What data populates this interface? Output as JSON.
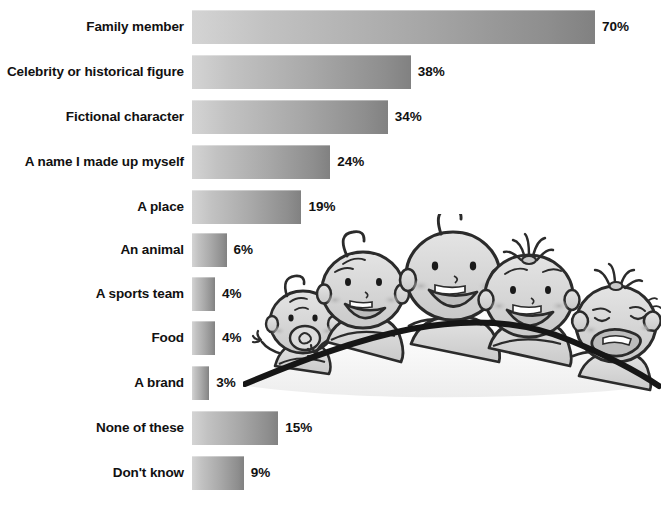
{
  "chart_data": {
    "type": "bar",
    "orientation": "horizontal",
    "title": "",
    "subtitle": "",
    "xlabel": "",
    "ylabel": "",
    "xlim": [
      0,
      70
    ],
    "grid": false,
    "legend": null,
    "value_suffix": "%",
    "categories": [
      "Family member",
      "Celebrity or historical figure",
      "Fictional character",
      "A name I made up myself",
      "A place",
      "An animal",
      "A sports team",
      "Food",
      "A brand",
      "None of these",
      "Don't know"
    ],
    "values": [
      70,
      38,
      34,
      24,
      19,
      6,
      4,
      4,
      3,
      15,
      9
    ],
    "data_labels": [
      "70%",
      "38%",
      "34%",
      "24%",
      "19%",
      "6%",
      "4%",
      "4%",
      "3%",
      "15%",
      "9%"
    ],
    "bars": [
      {
        "label": "Family member",
        "value": 70,
        "value_label": "70%",
        "top": 10
      },
      {
        "label": "Celebrity or historical figure",
        "value": 38,
        "value_label": "38%",
        "top": 55
      },
      {
        "label": "Fictional character",
        "value": 34,
        "value_label": "34%",
        "top": 100
      },
      {
        "label": "A name I made up myself",
        "value": 24,
        "value_label": "24%",
        "top": 145
      },
      {
        "label": "A place",
        "value": 19,
        "value_label": "19%",
        "top": 190
      },
      {
        "label": "An animal",
        "value": 6,
        "value_label": "6%",
        "top": 233
      },
      {
        "label": "A sports team",
        "value": 4,
        "value_label": "4%",
        "top": 277
      },
      {
        "label": "Food",
        "value": 4,
        "value_label": "4%",
        "top": 321
      },
      {
        "label": "A brand",
        "value": 3,
        "value_label": "3%",
        "top": 366
      },
      {
        "label": "None of these",
        "value": 15,
        "value_label": "15%",
        "top": 411
      },
      {
        "label": "Don't know",
        "value": 9,
        "value_label": "9%",
        "top": 456
      }
    ]
  },
  "style": {
    "background": "#ffffff",
    "text_color": "#111111",
    "bar_gradient_start": "#d4d4d4",
    "bar_gradient_end": "#818181",
    "illustration_line": "#1a1a1a",
    "illustration_fill": "#d8d8d8"
  },
  "illustration": {
    "name": "five-cartoon-babies-behind-hill",
    "description": "Five smiling cartoon babies peeking over a curved hill",
    "babies": [
      {
        "name": "baby-with-pacifier",
        "expression": "pacifier"
      },
      {
        "name": "baby-waving",
        "expression": "laughing"
      },
      {
        "name": "baby-center",
        "expression": "big-smile"
      },
      {
        "name": "baby-with-topknot",
        "expression": "laughing"
      },
      {
        "name": "baby-crying-with-bow",
        "expression": "crying"
      }
    ]
  }
}
